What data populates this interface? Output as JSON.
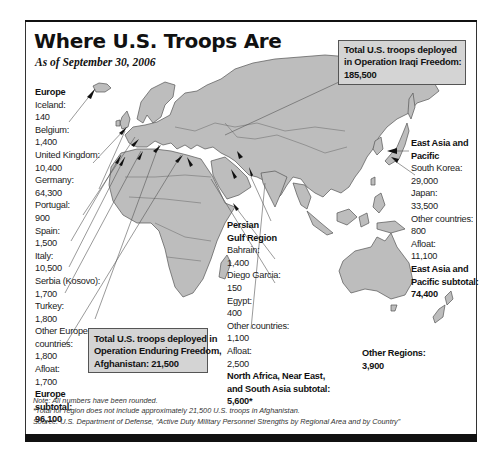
{
  "header": {
    "title": "Where U.S. Troops Are",
    "subtitle": "As of September 30, 2006"
  },
  "callouts": {
    "iraq": {
      "line1": "Total U.S. troops deployed",
      "line2": "in Operation Iraqi Freedom:",
      "line3": "185,500"
    },
    "afghanistan": {
      "line1": "Total U.S. troops deployed in",
      "line2": "Operation Enduring Freedom,",
      "line3": "Afghanistan: 21,500"
    }
  },
  "regions": {
    "europe": {
      "heading": "Europe",
      "entries": [
        {
          "label": "Iceland:",
          "value": "140"
        },
        {
          "label": "Belgium:",
          "value": "1,400"
        },
        {
          "label": "United Kingdom:",
          "value": "10,400"
        },
        {
          "label": "Germany:",
          "value": "64,300"
        },
        {
          "label": "Portugal:",
          "value": "900"
        },
        {
          "label": "Spain:",
          "value": "1,500"
        },
        {
          "label": "Italy:",
          "value": "10,500"
        },
        {
          "label": "Serbia (Kosovo):",
          "value": "1,700"
        },
        {
          "label": "Turkey:",
          "value": "1,800"
        },
        {
          "label": "Other European",
          "label2": "countries:",
          "value": "1,800"
        },
        {
          "label": "Afloat:",
          "value": "1,700"
        }
      ],
      "subtotal_line1": "Europe",
      "subtotal_line2": "subtotal:",
      "subtotal_value": "96,100"
    },
    "persian_gulf": {
      "heading_line1": "Persian",
      "heading_line2": "Gulf Region",
      "entries": [
        {
          "label": "Bahrain:",
          "value": "1,400"
        },
        {
          "label": "Diego Garcia:",
          "value": "150"
        },
        {
          "label": "Egypt:",
          "value": "400"
        },
        {
          "label": "Other countries:",
          "value": "1,100"
        },
        {
          "label": "Afloat:",
          "value": "2,500"
        }
      ],
      "subtotal_line1": "North Africa, Near East,",
      "subtotal_line2": "and South Asia subtotal:",
      "subtotal_value": "5,600*"
    },
    "east_asia": {
      "heading_line1": "East Asia and",
      "heading_line2": "Pacific",
      "entries": [
        {
          "label": "South Korea:",
          "value": "29,000"
        },
        {
          "label": "Japan:",
          "value": "33,500"
        },
        {
          "label": "Other countries:",
          "value": "800"
        },
        {
          "label": "Afloat:",
          "value": "11,100"
        }
      ],
      "subtotal_line1": "East Asia and",
      "subtotal_line2": "Pacific subtotal:",
      "subtotal_value": "74,400"
    },
    "other": {
      "heading": "Other Regions:",
      "value": "3,900"
    }
  },
  "footer": {
    "note": "Note: All numbers have been rounded.",
    "footnote": "*Total for region does not include approximately 21,500 U.S. troops in Afghanistan.",
    "source": "Source: U.S. Department of Defense, “Active Duty Military Personnel Strengths by Regional Area and by Country”"
  },
  "colors": {
    "land": "#bdbdbd",
    "border": "#555555",
    "callout_bg": "#d4d4d4",
    "frame_bar": "#111111"
  }
}
